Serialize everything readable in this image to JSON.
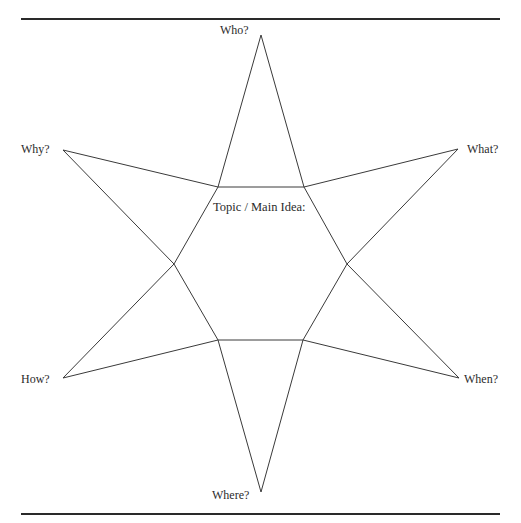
{
  "diagram": {
    "type": "six-point star graphic organizer",
    "center_label": "Topic / Main Idea:",
    "points": [
      {
        "id": "top",
        "label": "Who?"
      },
      {
        "id": "upper-right",
        "label": "What?"
      },
      {
        "id": "lower-right",
        "label": "When?"
      },
      {
        "id": "bottom",
        "label": "Where?"
      },
      {
        "id": "lower-left",
        "label": "How?"
      },
      {
        "id": "upper-left",
        "label": "Why?"
      }
    ],
    "line_color": "#3a3a3a",
    "rule_color": "#2a2a2a"
  }
}
